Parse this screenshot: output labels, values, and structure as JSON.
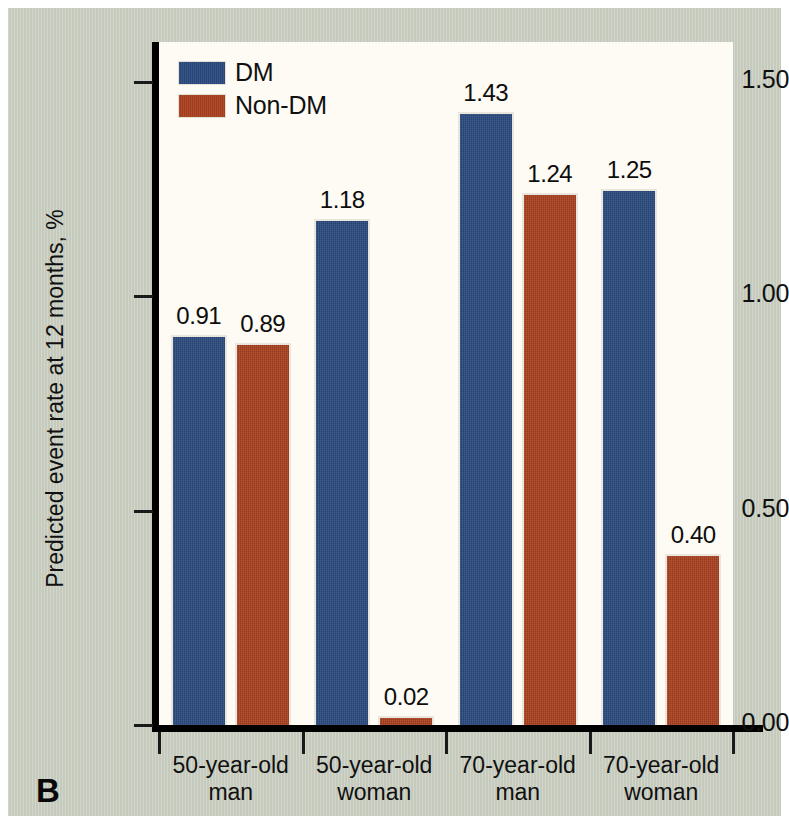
{
  "panel": {
    "letter": "B"
  },
  "chart_data": {
    "type": "bar",
    "title": "",
    "xlabel": "",
    "ylabel": "Predicted event rate at 12 months, %",
    "ylim": [
      0.0,
      1.5
    ],
    "ytick_labels": [
      "1.50",
      "1.00",
      "0.50",
      "0.00"
    ],
    "ytick_values": [
      1.5,
      1.0,
      0.5,
      0.0
    ],
    "grid": false,
    "legend_position": "top-left",
    "categories": [
      "50-year-old man",
      "50-year-old woman",
      "70-year-old man",
      "70-year-old woman"
    ],
    "category_lines": [
      [
        "50-year-old",
        "man"
      ],
      [
        "50-year-old",
        "woman"
      ],
      [
        "70-year-old",
        "man"
      ],
      [
        "70-year-old",
        "woman"
      ]
    ],
    "series": [
      {
        "name": "DM",
        "color": "#2b4a7e",
        "values": [
          0.91,
          1.18,
          1.43,
          1.25
        ],
        "data_labels": [
          "0.91",
          "1.18",
          "1.43",
          "1.25"
        ]
      },
      {
        "name": "Non-DM",
        "color": "#a9401f",
        "values": [
          0.89,
          0.02,
          1.24,
          0.4
        ],
        "data_labels": [
          "0.89",
          "0.02",
          "1.24",
          "0.40"
        ]
      }
    ]
  },
  "legend": {
    "items": [
      {
        "label": "DM",
        "color": "#2b4a7e"
      },
      {
        "label": "Non-DM",
        "color": "#a9401f"
      }
    ]
  },
  "colors": {
    "background": "#c9cec1",
    "plot_area": "#fdfbf4",
    "axis": "#000000",
    "series_dm": "#2b4a7e",
    "series_nondm": "#a9401f"
  }
}
